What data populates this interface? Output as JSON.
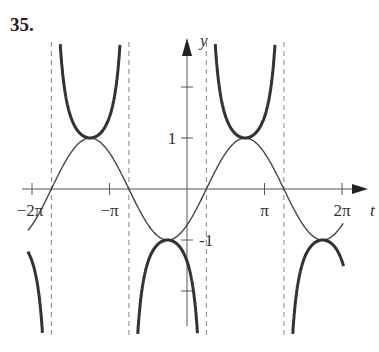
{
  "problem_label": "35.",
  "chart_data": {
    "type": "line",
    "title": "",
    "xlabel": "t",
    "ylabel": "y",
    "xlim": [
      -6.8,
      6.9
    ],
    "ylim": [
      -2.9,
      2.9
    ],
    "x_ticks": [
      "-2π",
      "-π",
      "π",
      "2π"
    ],
    "y_ticks": [
      "1",
      "-1"
    ],
    "series": [
      {
        "name": "y = sin(t - π/4)",
        "style": "thin",
        "function": "sin(t - pi/4)"
      },
      {
        "name": "y = csc(t - π/4)",
        "style": "bold",
        "function": "1/sin(t - pi/4)"
      }
    ],
    "asymptotes": [
      "t = -7π/4",
      "t = -3π/4",
      "t = π/4",
      "t = 5π/4"
    ],
    "grid": false
  },
  "axis": {
    "x_label": "t",
    "y_label": "y",
    "ticks": {
      "neg2pi": "−2π",
      "negpi": "−π",
      "pi": "π",
      "twopi": "2π",
      "one": "1",
      "negone": "-1"
    }
  }
}
